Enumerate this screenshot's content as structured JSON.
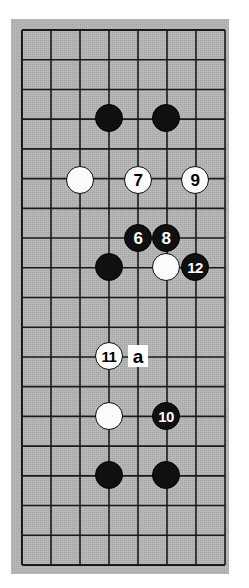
{
  "figure": {
    "kind": "go-board-diagram",
    "board": {
      "columns": 8,
      "rows": 19,
      "grid_spacing_px": 29,
      "origin_x_px": 22,
      "origin_y_px": 30,
      "background_color": "#b4b4b4",
      "line_color": "#1a1a1a",
      "page_background_color": "#ffffff"
    },
    "colors": {
      "black_stone": "#101010",
      "white_stone": "#fbfbfb",
      "black_stone_number": "#ffffff",
      "white_stone_number": "#000000",
      "label_background": "#ffffff",
      "label_text": "#000000"
    },
    "stones": [
      {
        "id": "stone-black-c4r4",
        "color": "black",
        "label": "",
        "col": 4,
        "row": 4,
        "x": 109,
        "y": 118
      },
      {
        "id": "stone-black-c6r4",
        "color": "black",
        "label": "",
        "col": 6,
        "row": 4,
        "x": 166,
        "y": 118
      },
      {
        "id": "stone-white-c3r6",
        "color": "white",
        "label": "",
        "col": 3,
        "row": 6,
        "x": 80,
        "y": 180
      },
      {
        "id": "stone-white-7",
        "color": "white",
        "label": "7",
        "col": 5,
        "row": 6,
        "x": 138,
        "y": 180
      },
      {
        "id": "stone-white-9",
        "color": "white",
        "label": "9",
        "col": 7,
        "row": 6,
        "x": 195,
        "y": 180
      },
      {
        "id": "stone-black-6",
        "color": "black",
        "label": "6",
        "col": 5,
        "row": 8,
        "x": 138,
        "y": 238
      },
      {
        "id": "stone-black-8",
        "color": "black",
        "label": "8",
        "col": 6,
        "row": 8,
        "x": 166,
        "y": 238
      },
      {
        "id": "stone-black-c4r9",
        "color": "black",
        "label": "",
        "col": 4,
        "row": 9,
        "x": 109,
        "y": 267
      },
      {
        "id": "stone-white-c6r9",
        "color": "white",
        "label": "",
        "col": 6,
        "row": 9,
        "x": 166,
        "y": 267
      },
      {
        "id": "stone-black-12",
        "color": "black",
        "label": "12",
        "col": 7,
        "row": 9,
        "x": 195,
        "y": 267
      },
      {
        "id": "stone-white-11",
        "color": "white",
        "label": "11",
        "col": 4,
        "row": 12,
        "x": 109,
        "y": 356
      },
      {
        "id": "stone-white-c4r14",
        "color": "white",
        "label": "",
        "col": 4,
        "row": 14,
        "x": 109,
        "y": 416
      },
      {
        "id": "stone-black-10",
        "color": "black",
        "label": "10",
        "col": 6,
        "row": 14,
        "x": 166,
        "y": 416
      },
      {
        "id": "stone-black-c4r16",
        "color": "black",
        "label": "",
        "col": 4,
        "row": 16,
        "x": 109,
        "y": 475
      },
      {
        "id": "stone-black-c6r16",
        "color": "black",
        "label": "",
        "col": 6,
        "row": 16,
        "x": 166,
        "y": 475
      }
    ],
    "point_labels": [
      {
        "id": "point-label-a",
        "text": "a",
        "col": 5,
        "row": 12,
        "x": 138,
        "y": 356
      }
    ]
  }
}
